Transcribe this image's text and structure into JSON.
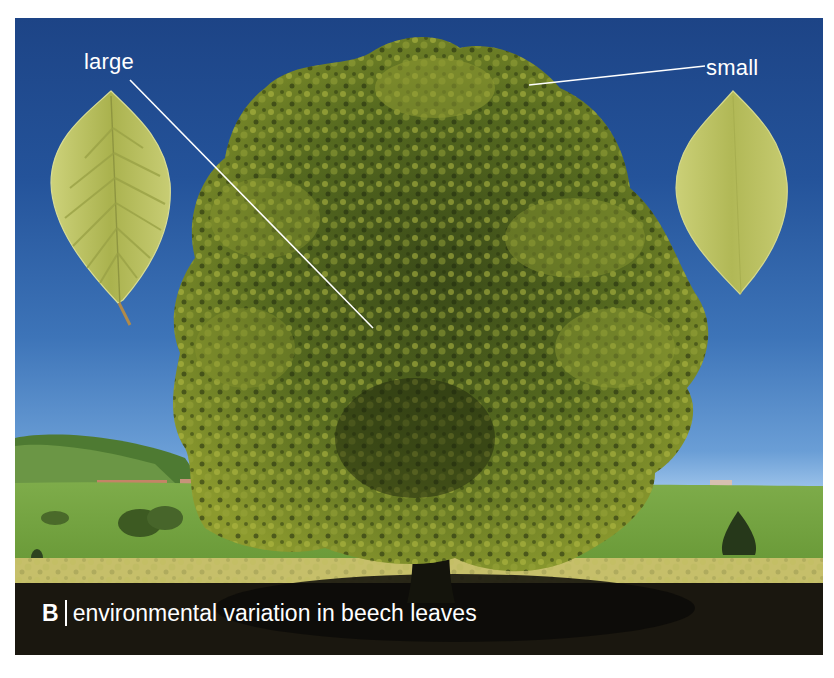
{
  "figure": {
    "panel_letter": "B",
    "caption": "environmental variation in beech leaves",
    "labels": {
      "large": "large",
      "small": "small"
    },
    "colors": {
      "sky_top": "#1d4486",
      "sky_horizon": "#b7d6f2",
      "foliage_light": "#a6ad3a",
      "foliage_dark": "#2a3512",
      "meadow": "#7fa846",
      "flowers": "#c9c06a",
      "shadow": "#16130d",
      "leaf_large": "#b5bb5a",
      "leaf_small": "#bcc062",
      "annotation": "#ffffff"
    }
  }
}
